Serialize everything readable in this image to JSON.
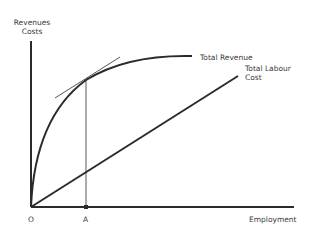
{
  "diagram": {
    "title": "",
    "y_axis_label_line1": "Revenues",
    "y_axis_label_line2": "Costs",
    "x_axis_label": "Employment",
    "origin_label": "O",
    "point_label": "A",
    "curves": [
      {
        "name": "Total Revenue",
        "type": "concave-curve"
      },
      {
        "name": "Total Labour Cost",
        "type": "straight-line",
        "label_line1": "Total Labour",
        "label_line2": "Cost"
      }
    ],
    "annotations": [
      "tangent line to Total Revenue at employment A",
      "vertical line from A to Total Revenue curve"
    ],
    "colors": {
      "axis": "#2b2b2b",
      "curve": "#2b2b2b",
      "text": "#3a3a3a",
      "background": "#ffffff"
    }
  }
}
